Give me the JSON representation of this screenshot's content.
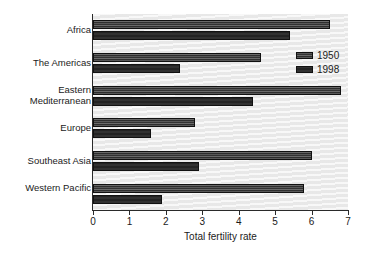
{
  "chart_data": {
    "type": "bar",
    "orientation": "horizontal",
    "title": "",
    "xlabel": "Total fertility rate",
    "ylabel": "",
    "xlim": [
      0,
      7
    ],
    "xticks": [
      "0",
      "1",
      "2",
      "3",
      "4",
      "5",
      "6",
      "7"
    ],
    "grid": false,
    "legend_position": "upper-right",
    "categories": [
      "Africa",
      "The Americas",
      "Eastern Mediterranean",
      "Europe",
      "Southeast Asia",
      "Western Pacific"
    ],
    "series": [
      {
        "name": "1950",
        "values": [
          6.5,
          4.6,
          6.8,
          2.8,
          6.0,
          5.8
        ]
      },
      {
        "name": "1998",
        "values": [
          5.4,
          2.4,
          4.4,
          1.6,
          2.9,
          1.9
        ]
      }
    ]
  },
  "legend": {
    "entries": [
      {
        "label": "1950",
        "swatch": "hatched-dark-swatch"
      },
      {
        "label": "1998",
        "swatch": "solid-dark-swatch"
      }
    ]
  },
  "colors": {
    "plot_background": "#efefef",
    "axis": "#2a2a2a",
    "series_1950": "#3a3a3a",
    "series_1998": "#2b2b2b",
    "text": "#1b1b1b"
  }
}
